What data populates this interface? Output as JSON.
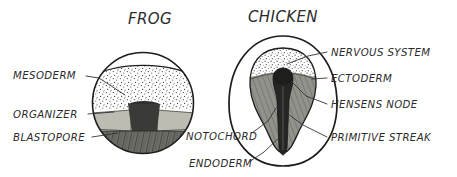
{
  "figure": {
    "background_color": "#ffffff",
    "ink_color": "#2b2b2b",
    "style": "hand-drawn pen and ink biology diagram"
  },
  "panels": [
    {
      "id": "frog",
      "title": "FROG",
      "title_x": 150,
      "title_y": 24,
      "shape": "circle"
    },
    {
      "id": "chicken",
      "title": "CHICKEN",
      "title_x": 283,
      "title_y": 22,
      "shape": "oval"
    }
  ],
  "labels": [
    {
      "id": "mesoderm",
      "text": "MESODERM",
      "panel": "frog",
      "x": 13,
      "y": 79,
      "anchor": "start",
      "leader": "M 86,76 L 99,78 L 125,95"
    },
    {
      "id": "organizer",
      "text": "ORGANIZER",
      "panel": "frog",
      "x": 13,
      "y": 118,
      "anchor": "start",
      "leader": "M 88,114 L 114,112"
    },
    {
      "id": "blastopore",
      "text": "BLASTOPORE",
      "panel": "frog",
      "x": 13,
      "y": 141,
      "anchor": "start",
      "leader": "M 92,137 L 118,133"
    },
    {
      "id": "notochord",
      "text": "NOTOCHORD",
      "panel": "chicken",
      "x": 186,
      "y": 140,
      "anchor": "start",
      "leader": "M 252,133 L 268,121 L 276,108"
    },
    {
      "id": "endoderm",
      "text": "ENDODERM",
      "panel": "chicken",
      "x": 189,
      "y": 167,
      "anchor": "start",
      "leader": "M 249,162 L 264,152 L 281,136"
    },
    {
      "id": "nervous-system",
      "text": "NERVOUS SYSTEM",
      "panel": "chicken",
      "x": 331,
      "y": 56,
      "anchor": "start",
      "leader": "M 327,52 L 308,56 L 287,64"
    },
    {
      "id": "ectoderm",
      "text": "ECTODERM",
      "panel": "chicken",
      "x": 331,
      "y": 82,
      "anchor": "start",
      "leader": "M 327,78 L 312,79"
    },
    {
      "id": "hensens-node",
      "text": "HENSENS NODE",
      "panel": "chicken",
      "x": 331,
      "y": 108,
      "anchor": "start",
      "leader": "M 327,104 L 306,96 L 292,82"
    },
    {
      "id": "primitive-streak",
      "text": "PRIMITIVE STREAK",
      "panel": "chicken",
      "x": 331,
      "y": 141,
      "anchor": "start",
      "leader": "M 327,137 L 303,125 L 288,114"
    }
  ],
  "frog_embryo": {
    "center_x": 143,
    "center_y": 103,
    "radius": 51,
    "regions": [
      {
        "name": "animal-cap-clear",
        "fill": "#ffffff"
      },
      {
        "name": "mesoderm-stipple",
        "fill": "#fdfdfd",
        "texture": "stipple"
      },
      {
        "name": "organizer-band-left",
        "fill": "#b9b9b0"
      },
      {
        "name": "organizer-band-right",
        "fill": "#b9b9b0"
      },
      {
        "name": "blastopore-notch",
        "fill": "#3a3a38"
      },
      {
        "name": "vegetal-yolk",
        "fill": "#6b6b66",
        "texture": "hatch"
      }
    ]
  },
  "chicken_embryo": {
    "center_x": 283,
    "center_y": 105,
    "outer_rx": 54,
    "outer_ry": 68,
    "regions": [
      {
        "name": "area-opaca-clear",
        "fill": "#ffffff"
      },
      {
        "name": "nervous-system-stipple",
        "fill": "#fbfbfb",
        "texture": "stipple"
      },
      {
        "name": "mesoderm-shield",
        "fill": "#8d8d88"
      },
      {
        "name": "primitive-streak",
        "fill": "#2a2a28"
      },
      {
        "name": "hensens-node",
        "fill": "#222220"
      }
    ]
  }
}
